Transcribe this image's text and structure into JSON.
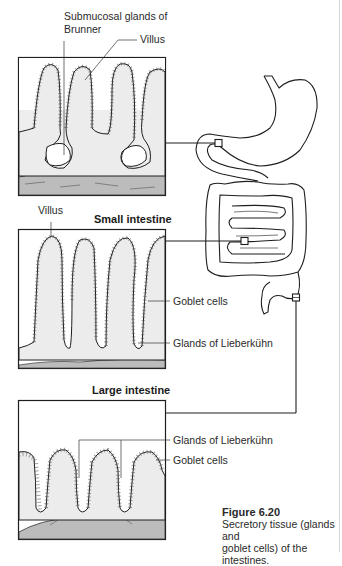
{
  "figure": {
    "number": "Figure 6.20",
    "caption_line1": "Secretory tissue (glands and",
    "caption_line2": "goblet cells) of the intestines."
  },
  "panels": [
    {
      "id": "duodenum",
      "title": "",
      "labels": {
        "brunner_line1": "Submucosal glands of",
        "brunner_line2": "Brunner",
        "villus": "Villus"
      }
    },
    {
      "id": "small-intestine",
      "title": "Small intestine",
      "labels": {
        "villus": "Villus",
        "goblet": "Goblet cells",
        "glands": "Glands of Lieberkühn"
      }
    },
    {
      "id": "large-intestine",
      "title": "Large intestine",
      "labels": {
        "glands": "Glands of Lieberkühn",
        "goblet": "Goblet cells"
      }
    }
  ],
  "colors": {
    "line": "#1e1e1e",
    "tissue_fill": "#ececec",
    "submucosa_fill": "#bdbdbd",
    "background": "#ffffff"
  }
}
